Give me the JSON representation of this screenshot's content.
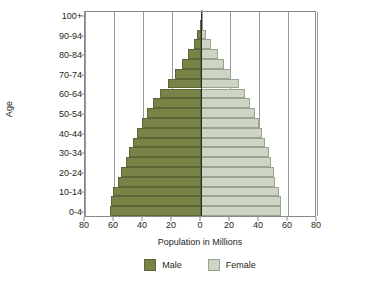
{
  "chart_data": {
    "type": "bar",
    "title": "",
    "subtype": "population-pyramid",
    "xlabel": "Population in Millions",
    "ylabel": "Age",
    "xlim": [
      -80,
      80
    ],
    "xticks": [
      80,
      60,
      40,
      20,
      0,
      20,
      40,
      60,
      80
    ],
    "xtick_labels": [
      "80",
      "60",
      "40",
      "20",
      "0",
      "20",
      "40",
      "60",
      "80"
    ],
    "grid": true,
    "legend_position": "bottom",
    "categories": [
      "0-4",
      "5-9",
      "10-14",
      "15-19",
      "20-24",
      "25-29",
      "30-34",
      "35-39",
      "40-44",
      "45-49",
      "50-54",
      "55-59",
      "60-64",
      "65-69",
      "70-74",
      "75-79",
      "80-84",
      "85-89",
      "90-94",
      "95-99",
      "100+"
    ],
    "ytick_labels": [
      "0-4",
      "10-14",
      "20-24",
      "30-34",
      "40-44",
      "50-54",
      "60-64",
      "70-74",
      "80-84",
      "90-94",
      "100+"
    ],
    "series": [
      {
        "name": "Male",
        "color": "#788447",
        "values": [
          63,
          62,
          61,
          57,
          55,
          52,
          50,
          47,
          44,
          41,
          37,
          33,
          28,
          23,
          18,
          13,
          9,
          5,
          2.5,
          1.0,
          0.3
        ]
      },
      {
        "name": "Female",
        "color": "#cdd6c4",
        "values": [
          55,
          55,
          54,
          51,
          50,
          48,
          47,
          44,
          42,
          40,
          37,
          34,
          30,
          26,
          21,
          16,
          12,
          7,
          3.5,
          1.5,
          0.4
        ]
      }
    ]
  },
  "legend": {
    "male_label": "Male",
    "female_label": "Female"
  },
  "axes": {
    "y_title": "Age",
    "x_title": "Population in Millions"
  }
}
